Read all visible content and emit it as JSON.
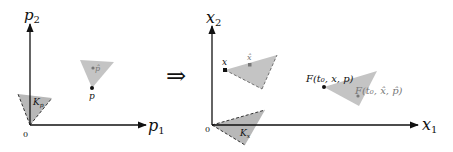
{
  "left_panel": {
    "x_axis_label": "p",
    "x_axis_sub": "1",
    "y_axis_label": "p",
    "y_axis_sub": "2",
    "origin_label": "0",
    "cone_label": "K",
    "cone_sub": "p",
    "point_label": "p",
    "point_hat_label": "p̂"
  },
  "implies_symbol": "⇒",
  "right_panel": {
    "x_axis_label": "x",
    "x_axis_sub": "1",
    "y_axis_label": "x",
    "y_axis_sub": "2",
    "origin_label": "0",
    "cone_label": "K",
    "cone_sub": "x",
    "point_label": "x",
    "point_hat_label": "x̂",
    "image_point_label": "F(t₀, x, p)",
    "image_hat_point_label": "F(t₀, x̂, p̂)"
  },
  "colors": {
    "cone_fill": "#b8b8b8",
    "axis": "#111111",
    "hat_label": "#777777"
  }
}
